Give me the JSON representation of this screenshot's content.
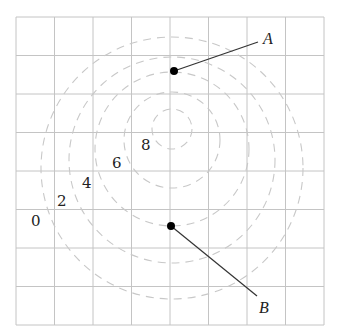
{
  "diagram": {
    "type": "contour-map",
    "grid": {
      "columns": 8,
      "rows": 8,
      "left": 16,
      "top": 17,
      "cell": 38.5,
      "color": "#c4c4c4"
    },
    "contours": [
      {
        "level": "0",
        "cx": 172,
        "cy": 168,
        "r": 131
      },
      {
        "level": "2",
        "cx": 172,
        "cy": 160,
        "r": 103
      },
      {
        "level": "4",
        "cx": 172,
        "cy": 149,
        "r": 77
      },
      {
        "level": "6",
        "cx": 172,
        "cy": 140,
        "r": 48
      },
      {
        "level": "8",
        "cx": 172,
        "cy": 129,
        "r": 20
      }
    ],
    "level_labels": [
      {
        "text": "0",
        "x": 31,
        "y": 226
      },
      {
        "text": "2",
        "x": 57,
        "y": 206
      },
      {
        "text": "4",
        "x": 82,
        "y": 188
      },
      {
        "text": "6",
        "x": 112,
        "y": 168
      },
      {
        "text": "8",
        "x": 141,
        "y": 150
      }
    ],
    "points": [
      {
        "name": "A",
        "x": 174,
        "y": 71,
        "leader_to": [
          258,
          42
        ],
        "label_x": 263,
        "label_y": 44
      },
      {
        "name": "B",
        "x": 171,
        "y": 226,
        "leader_to": [
          257,
          296
        ],
        "label_x": 259,
        "label_y": 313
      }
    ]
  }
}
